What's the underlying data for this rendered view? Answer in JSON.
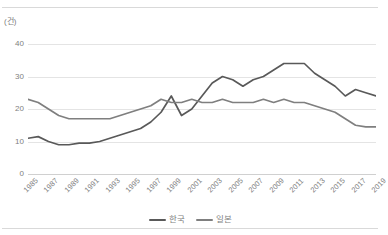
{
  "chart": {
    "title": "",
    "unit_label": "(건)",
    "y_axis": {
      "ticks": [
        "0",
        "10",
        "20",
        "30",
        "40"
      ]
    },
    "legend": [
      {
        "label": "한국",
        "color": "#595959"
      },
      {
        "label": "일본",
        "color": "#7f7f7f"
      }
    ]
  },
  "chart_data": {
    "type": "line",
    "title": "",
    "xlabel": "",
    "ylabel": "(건)",
    "ylim": [
      0,
      40
    ],
    "ytick_labels": [
      "0",
      "10",
      "20",
      "30",
      "40"
    ],
    "grid": true,
    "legend_position": "bottom",
    "x": [
      1985,
      1986,
      1987,
      1988,
      1989,
      1990,
      1991,
      1992,
      1993,
      1994,
      1995,
      1996,
      1997,
      1998,
      1999,
      2000,
      2001,
      2002,
      2003,
      2004,
      2005,
      2006,
      2007,
      2008,
      2009,
      2010,
      2011,
      2012,
      2013,
      2014,
      2015,
      2016,
      2017,
      2018,
      2019
    ],
    "xtick_labels": [
      "1985",
      "1987",
      "1989",
      "1991",
      "1993",
      "1995",
      "1997",
      "1999",
      "2001",
      "2003",
      "2005",
      "2007",
      "2009",
      "2011",
      "2013",
      "2015",
      "2017",
      "2019"
    ],
    "series": [
      {
        "name": "한국",
        "color": "#595959",
        "values": [
          11,
          11.5,
          10,
          9,
          9,
          9.5,
          9.5,
          10,
          11,
          12,
          13,
          14,
          16,
          19,
          24,
          18,
          20,
          24,
          28,
          30,
          29,
          27,
          29,
          30,
          32,
          34,
          34,
          34,
          31,
          29,
          27,
          24,
          26,
          25,
          24
        ]
      },
      {
        "name": "일본",
        "color": "#7f7f7f",
        "values": [
          23,
          22,
          20,
          18,
          17,
          17,
          17,
          17,
          17,
          18,
          19,
          20,
          21,
          23,
          22,
          22,
          23,
          22,
          22,
          23,
          22,
          22,
          22,
          23,
          22,
          23,
          22,
          22,
          21,
          20,
          19,
          17,
          15,
          14.5,
          14.5
        ]
      }
    ]
  }
}
